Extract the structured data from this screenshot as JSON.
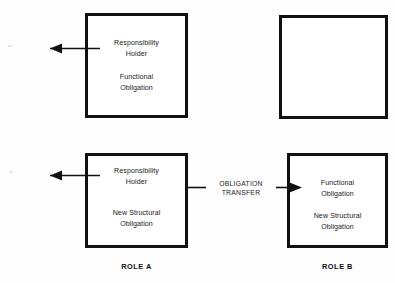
{
  "diagram": {
    "title_hidden": "",
    "boxes": [
      {
        "id": "top-left",
        "role": "A",
        "lines": [
          "Responsibility\nHolder",
          "Functional\nObligation"
        ]
      },
      {
        "id": "top-right",
        "role": "B",
        "lines": []
      },
      {
        "id": "bottom-left",
        "role": "A",
        "lines": [
          "Responsibility\nHolder",
          "New Structural\nObligation"
        ]
      },
      {
        "id": "bottom-right",
        "role": "B",
        "lines": [
          "Functional\nObligation",
          "New Structural\nObligation"
        ]
      }
    ],
    "transfer": {
      "label": "OBLIGATION\nTRANSFER",
      "direction": "left-to-right"
    },
    "captions": {
      "role_a": "ROLE  A",
      "role_b": "ROLE  B"
    },
    "colors": {
      "stroke": "#111111",
      "text": "#1a1a1a",
      "background": "#fefefe"
    }
  }
}
